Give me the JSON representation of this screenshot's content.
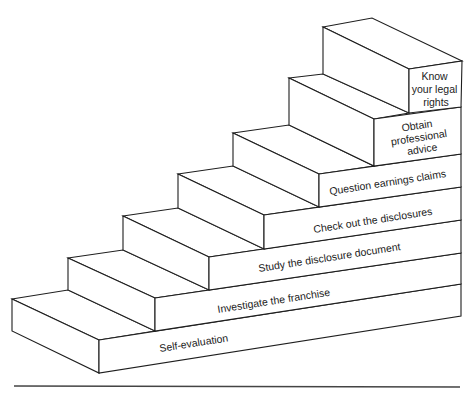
{
  "diagram": {
    "type": "staircase",
    "steps": [
      {
        "index": 1,
        "label": "Self-evaluation"
      },
      {
        "index": 2,
        "label": "Investigate the franchise"
      },
      {
        "index": 3,
        "label": "Study the disclosure document"
      },
      {
        "index": 4,
        "label": "Check out the disclosures"
      },
      {
        "index": 5,
        "label": "Question earnings claims"
      },
      {
        "index": 6,
        "label_lines": [
          "Obtain",
          "professional",
          "advice"
        ]
      },
      {
        "index": 7,
        "label_lines": [
          "Know",
          "your legal",
          "rights"
        ]
      }
    ]
  },
  "colors": {
    "line": "#1e1e1e",
    "background": "#ffffff",
    "text": "#222222"
  }
}
